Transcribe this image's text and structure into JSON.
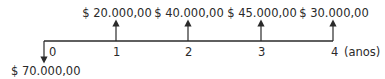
{
  "diagram": {
    "type": "cash-flow",
    "period_unit": "(anos)",
    "outflow": {
      "period": "0",
      "label": "$ 70.000,00"
    },
    "inflows": [
      {
        "period": "1",
        "label": "$ 20.000,00"
      },
      {
        "period": "2",
        "label": "$ 40.000,00"
      },
      {
        "period": "3",
        "label": "$ 45.000,00"
      },
      {
        "period": "4",
        "label": "$ 30.000,00"
      }
    ],
    "ticks": [
      "0",
      "1",
      "2",
      "3",
      "4"
    ],
    "line_color": "#2a2a2a"
  }
}
